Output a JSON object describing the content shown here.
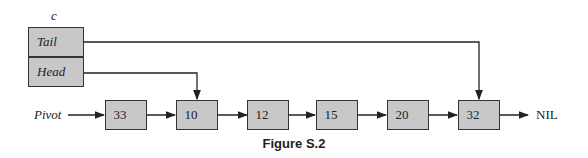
{
  "list_label": "c",
  "fields": {
    "tail": "Tail",
    "head": "Head"
  },
  "pivot_label": "Pivot",
  "nodes": [
    {
      "value": "33"
    },
    {
      "value": "10"
    },
    {
      "value": "12"
    },
    {
      "value": "15"
    },
    {
      "value": "20"
    },
    {
      "value": "32"
    }
  ],
  "terminator": "NIL",
  "caption": "Figure S.2"
}
